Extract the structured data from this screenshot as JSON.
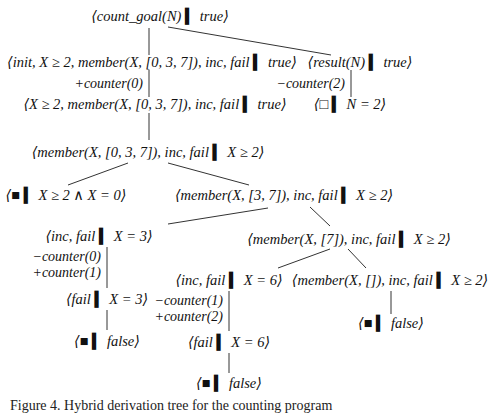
{
  "diagram": {
    "type": "derivation-tree",
    "nodes": [
      {
        "id": "n0",
        "text": "⟨count_goal(N) ▍ true⟩"
      },
      {
        "id": "n1",
        "text": "⟨init, X ≥ 2, member(X, [0, 3, 7]), inc, fail ▍ true⟩"
      },
      {
        "id": "n2",
        "text": "⟨result(N) ▍ true⟩"
      },
      {
        "id": "n3",
        "text": "⟨X ≥ 2, member(X, [0, 3, 7]), inc, fail ▍ true⟩"
      },
      {
        "id": "n4",
        "text": "⟨□ ▍ N = 2⟩"
      },
      {
        "id": "n5",
        "text": "⟨member(X, [0, 3, 7]), inc, fail ▍ X ≥ 2⟩"
      },
      {
        "id": "n6",
        "text": "⟨■ ▍ X ≥ 2 ∧ X = 0⟩"
      },
      {
        "id": "n7",
        "text": "⟨member(X, [3, 7]), inc, fail ▍ X ≥ 2⟩"
      },
      {
        "id": "n8",
        "text": "⟨inc, fail ▍ X = 3⟩"
      },
      {
        "id": "n9",
        "text": "⟨member(X, [7]), inc, fail ▍ X ≥ 2⟩"
      },
      {
        "id": "n10",
        "text": "⟨fail ▍ X = 3⟩"
      },
      {
        "id": "n11",
        "text": "⟨inc, fail ▍ X = 6⟩"
      },
      {
        "id": "n12",
        "text": "⟨member(X, []), inc, fail ▍ X ≥ 2⟩"
      },
      {
        "id": "n13",
        "text": "⟨■ ▍ false⟩"
      },
      {
        "id": "n14",
        "text": "⟨fail ▍ X = 6⟩"
      },
      {
        "id": "n15",
        "text": "⟨■ ▍ false⟩"
      },
      {
        "id": "n16",
        "text": "⟨■ ▍ false⟩"
      }
    ],
    "edge_labels": {
      "e1_3": "+counter(0)",
      "e2_4": "−counter(2)",
      "e8_10_a": "−counter(0)",
      "e8_10_b": "+counter(1)",
      "e11_14_a": "−counter(1)",
      "e11_14_b": "+counter(2)"
    },
    "edges": [
      [
        "n0",
        "n1"
      ],
      [
        "n0",
        "n2"
      ],
      [
        "n1",
        "n3"
      ],
      [
        "n2",
        "n4"
      ],
      [
        "n3",
        "n5"
      ],
      [
        "n5",
        "n6"
      ],
      [
        "n5",
        "n7"
      ],
      [
        "n7",
        "n8"
      ],
      [
        "n7",
        "n9"
      ],
      [
        "n8",
        "n10"
      ],
      [
        "n9",
        "n11"
      ],
      [
        "n9",
        "n12"
      ],
      [
        "n10",
        "n13"
      ],
      [
        "n12",
        "n16"
      ],
      [
        "n11",
        "n14"
      ],
      [
        "n14",
        "n15"
      ]
    ]
  },
  "caption": "Figure 4.  Hybrid derivation tree for the counting program"
}
